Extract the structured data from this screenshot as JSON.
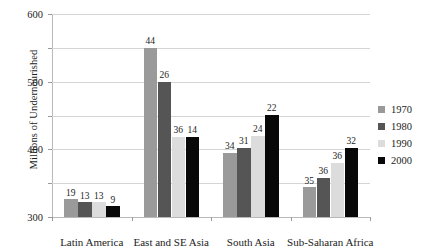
{
  "chart_data": {
    "type": "bar",
    "title": "",
    "xlabel": "",
    "ylabel": "Millions of Undernourished",
    "ylim": [
      0,
      600
    ],
    "yticks": [
      0,
      100,
      200,
      300,
      400,
      500,
      600
    ],
    "grid": true,
    "legend_position": "right",
    "categories": [
      "Latin America",
      "East and SE Asia",
      "South Asia",
      "Sub-Saharan Africa"
    ],
    "series": [
      {
        "name": "1970",
        "color": "#9a9a9a",
        "values": [
          53,
          500,
          190,
          88
        ],
        "point_labels": [
          "19",
          "44",
          "34",
          "35"
        ]
      },
      {
        "name": "1980",
        "color": "#555555",
        "values": [
          43,
          400,
          205,
          116
        ],
        "point_labels": [
          "13",
          "26",
          "31",
          "36"
        ]
      },
      {
        "name": "1990",
        "color": "#dcdcdc",
        "values": [
          43,
          237,
          240,
          161
        ],
        "point_labels": [
          "13",
          "36",
          "24",
          "36"
        ]
      },
      {
        "name": "2000",
        "color": "#080808",
        "values": [
          32,
          237,
          302,
          205
        ],
        "point_labels": [
          "9",
          "14",
          "22",
          "32"
        ]
      }
    ]
  }
}
